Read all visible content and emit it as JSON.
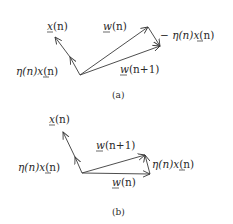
{
  "figure_a": {
    "caption": "(a)",
    "labels": {
      "x_n": {
        "sym": "x",
        "arg": "(n)",
        "underline": true
      },
      "eta_x_left": {
        "prefix": "η(n)",
        "sym": "x",
        "arg": "(n)"
      },
      "w_n": {
        "sym": "w",
        "arg": "(n)"
      },
      "minus_eta_x": {
        "prefix": "− η(n)",
        "sym": "x",
        "arg": "(n)"
      },
      "w_n1": {
        "sym": "w",
        "arg": "(n+1)"
      }
    },
    "description": "Weight update when sample is misclassified with w·x > 0: w(n+1) = w(n) − η(n)x(n)"
  },
  "figure_b": {
    "caption": "(b)",
    "labels": {
      "x_n": {
        "sym": "x",
        "arg": "(n)",
        "underline": true
      },
      "eta_x_left": {
        "prefix": "η(n)",
        "sym": "x",
        "arg": "(n)"
      },
      "w_n1": {
        "sym": "w",
        "arg": "(n+1)"
      },
      "eta_x_right": {
        "prefix": "η(n)",
        "sym": "x",
        "arg": "(n)"
      },
      "w_n": {
        "sym": "w",
        "arg": "(n)"
      }
    },
    "description": "Weight update when sample is misclassified with w·x < 0: w(n+1) = w(n) + η(n)x(n)"
  },
  "colors": {
    "ink": "#2a2a2a",
    "background": "#ffffff"
  }
}
